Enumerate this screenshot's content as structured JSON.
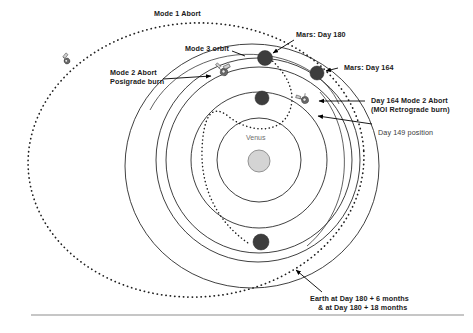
{
  "diagram": {
    "central_body_label": "Venus",
    "labels": {
      "mode1_abort": "Mode 1 Abort",
      "mode3_orbit": "Mode 3 orbit",
      "mode2_abort_line1": "Mode 2 Abort",
      "mode2_abort_line2": "Posigrade burn",
      "mars_day180": "Mars: Day 180",
      "mars_day164": "Mars: Day 164",
      "day164_mode2_line1": "Day 164 Mode 2 Abort",
      "day164_mode2_line2": "(MOI Retrograde burn)",
      "day149_position": "Day 149 position",
      "earth_line1": "Earth at Day 180 + 6 months",
      "earth_line2": "& at Day 180 + 18 months"
    },
    "colors": {
      "orbit_stroke": "#2b2b2b",
      "trajectory_stroke": "#1f1f1f",
      "planet_fill": "#3d3d3d",
      "sun_fill": "#d4d4d4",
      "text": "#1a1a1a",
      "venus_text": "#6e6e6e",
      "rule": "#8e8e8e",
      "background": "#ffffff"
    },
    "icons": {
      "spacecraft_mode1": "spacecraft-icon",
      "spacecraft_mode2": "spacecraft-icon",
      "spacecraft_day164": "spacecraft-icon",
      "sun": "sun-icon",
      "planet_mars_day180": "planet-icon",
      "planet_mars_day164": "planet-icon",
      "planet_day149": "planet-icon",
      "planet_earth": "planet-icon"
    }
  }
}
